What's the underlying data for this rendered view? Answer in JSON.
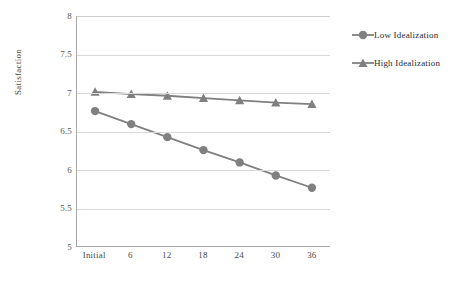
{
  "chart_data": {
    "type": "line",
    "title": "",
    "xlabel": "",
    "ylabel": "Satisfaction",
    "categories": [
      "Initial",
      "6",
      "12",
      "18",
      "24",
      "30",
      "36"
    ],
    "ylim": [
      5,
      8
    ],
    "yticks": [
      "5",
      "5.5",
      "6",
      "6.5",
      "7",
      "7.5",
      "8"
    ],
    "ytick_values": [
      5,
      5.5,
      6,
      6.5,
      7,
      7.5,
      8
    ],
    "grid": true,
    "legend_position": "right",
    "series": [
      {
        "name": "Low Idealization",
        "marker": "circle",
        "color": "#808080",
        "values": [
          6.76,
          6.59,
          6.42,
          6.25,
          6.09,
          5.92,
          5.76
        ]
      },
      {
        "name": "High Idealization",
        "marker": "triangle",
        "color": "#808080",
        "values": [
          7.01,
          6.98,
          6.96,
          6.93,
          6.9,
          6.87,
          6.85
        ]
      }
    ]
  },
  "legend": {
    "items": [
      {
        "label": "Low Idealization",
        "marker": "circle-marker-icon"
      },
      {
        "label": "High Idealization",
        "marker": "triangle-marker-icon"
      }
    ]
  },
  "colors": {
    "series": "#808080",
    "gridline": "#d9d9d9",
    "axis": "#a6a6a6",
    "tick_text": "#5a5a5a",
    "background": "#ffffff"
  }
}
